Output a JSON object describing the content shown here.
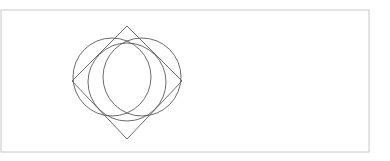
{
  "page": {
    "background_color": "#ffffff",
    "width": 390,
    "height": 161
  },
  "frame": {
    "name": "outer-rectangle-border",
    "stroke_color": "#c8c8c8",
    "stroke_width": 1,
    "x": 1,
    "y": 10,
    "width": 368,
    "height": 142
  },
  "figure": {
    "stroke_color": "#5a5a5a",
    "stroke_width": 0.9,
    "fill": "none",
    "diamond": {
      "name": "rotated-square-diamond",
      "points": "127,26 182,81 127,139 72,81",
      "vertex_top": {
        "x": 127,
        "y": 26
      },
      "vertex_right": {
        "x": 182,
        "y": 81
      },
      "vertex_bottom": {
        "x": 127,
        "y": 139
      },
      "vertex_left": {
        "x": 72,
        "y": 81
      }
    },
    "circles": [
      {
        "name": "inscribed-circle",
        "cx": 127,
        "cy": 82,
        "r": 39
      },
      {
        "name": "left-offset-circle",
        "cx": 112,
        "cy": 77,
        "r": 39
      },
      {
        "name": "right-offset-circle",
        "cx": 142,
        "cy": 77,
        "r": 39
      }
    ]
  },
  "labels": {
    "figure_caption": "Diamond with three overlapping circles"
  }
}
